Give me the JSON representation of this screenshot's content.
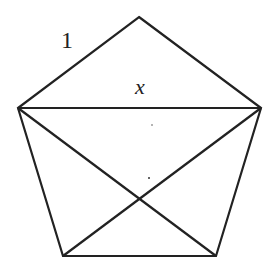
{
  "diagram": {
    "type": "regular pentagon with diagonals",
    "labels": {
      "side": "1",
      "diagonal": "x"
    },
    "vertices": {
      "top": [
        139,
        17
      ],
      "left": [
        18,
        108
      ],
      "right": [
        261,
        108
      ],
      "bottom_left": [
        63,
        256
      ],
      "bottom_right": [
        216,
        256
      ]
    },
    "stroke_color": "#222222",
    "background": "#ffffff"
  }
}
